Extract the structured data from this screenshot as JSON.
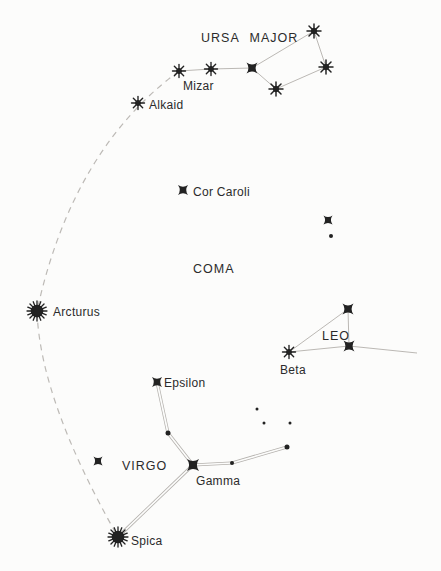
{
  "figure": {
    "width": 441,
    "height": 571,
    "background": "#fcfcfb",
    "ink_color": "#222222",
    "line_color": "#b3b0ac",
    "arc_color": "#bdbab6"
  },
  "constellation_labels": [
    {
      "id": "ursa-major",
      "text": "URSA MAJOR",
      "x": 201,
      "y": 42
    },
    {
      "id": "coma",
      "text": "COMA",
      "x": 193,
      "y": 273
    },
    {
      "id": "leo",
      "text": "LEO",
      "x": 322,
      "y": 340
    },
    {
      "id": "virgo",
      "text": "VIRGO",
      "x": 122,
      "y": 470
    }
  ],
  "star_labels": [
    {
      "id": "mizar",
      "text": "Mizar",
      "x": 183,
      "y": 90
    },
    {
      "id": "alkaid",
      "text": "Alkaid",
      "x": 149,
      "y": 109
    },
    {
      "id": "cor-caroli",
      "text": "Cor Caroli",
      "x": 193,
      "y": 196
    },
    {
      "id": "arcturus",
      "text": "Arcturus",
      "x": 53,
      "y": 316
    },
    {
      "id": "beta",
      "text": "Beta",
      "x": 280,
      "y": 374
    },
    {
      "id": "epsilon",
      "text": "Epsilon",
      "x": 164,
      "y": 387
    },
    {
      "id": "gamma",
      "text": "Gamma",
      "x": 196,
      "y": 485
    },
    {
      "id": "spica",
      "text": "Spica",
      "x": 131,
      "y": 545
    }
  ],
  "stars": [
    {
      "id": "alkaid",
      "type": "asterisk",
      "x": 138,
      "y": 103,
      "size": 13
    },
    {
      "id": "mizar",
      "type": "asterisk",
      "x": 179,
      "y": 71,
      "size": 13
    },
    {
      "id": "alioth",
      "type": "asterisk",
      "x": 211,
      "y": 69,
      "size": 13
    },
    {
      "id": "megrez",
      "type": "star4",
      "x": 252,
      "y": 68,
      "size": 11
    },
    {
      "id": "dubhe",
      "type": "asterisk",
      "x": 314,
      "y": 31,
      "size": 14
    },
    {
      "id": "merak",
      "type": "asterisk",
      "x": 326,
      "y": 67,
      "size": 14
    },
    {
      "id": "phecda",
      "type": "asterisk",
      "x": 276,
      "y": 89,
      "size": 14
    },
    {
      "id": "cor-caroli",
      "type": "star4",
      "x": 183,
      "y": 190,
      "size": 10
    },
    {
      "id": "coma-star",
      "type": "star4",
      "x": 328,
      "y": 220,
      "size": 9
    },
    {
      "id": "coma-dot",
      "type": "dot",
      "x": 331,
      "y": 236,
      "size": 4
    },
    {
      "id": "arcturus",
      "type": "burst",
      "x": 37,
      "y": 311,
      "size": 21
    },
    {
      "id": "leo-top",
      "type": "star4",
      "x": 348,
      "y": 309,
      "size": 11
    },
    {
      "id": "leo-mid",
      "type": "star4",
      "x": 349,
      "y": 346,
      "size": 11
    },
    {
      "id": "beta",
      "type": "asterisk",
      "x": 289,
      "y": 352,
      "size": 13
    },
    {
      "id": "epsilon",
      "type": "star4",
      "x": 157,
      "y": 382,
      "size": 10
    },
    {
      "id": "virgo-node",
      "type": "dot",
      "x": 168,
      "y": 433,
      "size": 5
    },
    {
      "id": "gamma",
      "type": "star4",
      "x": 193,
      "y": 465,
      "size": 12
    },
    {
      "id": "virgo-west",
      "type": "star4",
      "x": 98,
      "y": 461,
      "size": 9
    },
    {
      "id": "virgo-dot2",
      "type": "dot",
      "x": 232,
      "y": 463,
      "size": 4
    },
    {
      "id": "virgo-east",
      "type": "dot",
      "x": 287,
      "y": 447,
      "size": 5
    },
    {
      "id": "faint-1",
      "type": "dot",
      "x": 257,
      "y": 409,
      "size": 3
    },
    {
      "id": "faint-2",
      "type": "dot",
      "x": 264,
      "y": 423,
      "size": 3
    },
    {
      "id": "faint-3",
      "type": "dot",
      "x": 290,
      "y": 423,
      "size": 3
    },
    {
      "id": "spica",
      "type": "burst",
      "x": 118,
      "y": 537,
      "size": 21
    }
  ],
  "lines": [
    {
      "id": "mizar-alioth",
      "kind": "single",
      "x1": 179,
      "y1": 71,
      "x2": 211,
      "y2": 69
    },
    {
      "id": "alioth-megrez",
      "kind": "single",
      "x1": 211,
      "y1": 69,
      "x2": 252,
      "y2": 68
    },
    {
      "id": "megrez-dubhe",
      "kind": "single",
      "x1": 252,
      "y1": 68,
      "x2": 314,
      "y2": 31
    },
    {
      "id": "dubhe-merak",
      "kind": "single",
      "x1": 314,
      "y1": 31,
      "x2": 326,
      "y2": 67
    },
    {
      "id": "merak-phecda",
      "kind": "single",
      "x1": 326,
      "y1": 67,
      "x2": 276,
      "y2": 89
    },
    {
      "id": "phecda-megrez",
      "kind": "single",
      "x1": 276,
      "y1": 89,
      "x2": 252,
      "y2": 68
    },
    {
      "id": "beta-leo-top",
      "kind": "single",
      "x1": 289,
      "y1": 352,
      "x2": 348,
      "y2": 309
    },
    {
      "id": "leo-top-mid",
      "kind": "single",
      "x1": 348,
      "y1": 309,
      "x2": 349,
      "y2": 346
    },
    {
      "id": "beta-leo-mid",
      "kind": "single",
      "x1": 289,
      "y1": 352,
      "x2": 349,
      "y2": 346
    },
    {
      "id": "leo-mid-east",
      "kind": "single",
      "x1": 349,
      "y1": 346,
      "x2": 417,
      "y2": 353
    },
    {
      "id": "epsilon-node",
      "kind": "double",
      "x1": 157,
      "y1": 382,
      "x2": 168,
      "y2": 433
    },
    {
      "id": "node-gamma",
      "kind": "double",
      "x1": 168,
      "y1": 433,
      "x2": 193,
      "y2": 465
    },
    {
      "id": "gamma-dot2",
      "kind": "double",
      "x1": 193,
      "y1": 465,
      "x2": 232,
      "y2": 463
    },
    {
      "id": "dot2-east",
      "kind": "double",
      "x1": 232,
      "y1": 463,
      "x2": 287,
      "y2": 447
    },
    {
      "id": "gamma-spica",
      "kind": "double",
      "x1": 193,
      "y1": 465,
      "x2": 118,
      "y2": 537
    }
  ],
  "arc": {
    "id": "arc-to-arcturus-spike-to-spica",
    "path": "M 179 71 Q 72 150 37 311 Q 40 400 118 537",
    "dash": "6 5"
  }
}
